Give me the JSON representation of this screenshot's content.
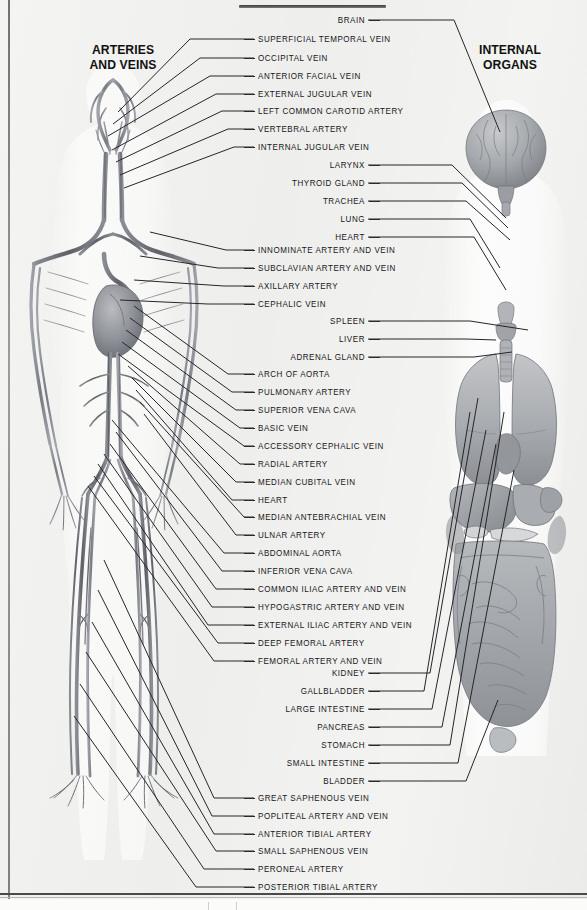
{
  "plate": {
    "heading_left": "ARTERIES\nAND VEINS",
    "heading_left_line1": "ARTERIES",
    "heading_left_line2": "AND VEINS",
    "heading_right_line1": "INTERNAL",
    "heading_right_line2": "ORGANS"
  },
  "labels_left": [
    {
      "text": "SUPERFICIAL TEMPORAL VEIN",
      "y": 39
    },
    {
      "text": "OCCIPITAL VEIN",
      "y": 58
    },
    {
      "text": "ANTERIOR FACIAL VEIN",
      "y": 76
    },
    {
      "text": "EXTERNAL JUGULAR VEIN",
      "y": 94
    },
    {
      "text": "LEFT COMMON CAROTID ARTERY",
      "y": 111
    },
    {
      "text": "VERTEBRAL ARTERY",
      "y": 129
    },
    {
      "text": "INTERNAL JUGULAR VEIN",
      "y": 147
    },
    {
      "text": "INNOMINATE ARTERY AND VEIN",
      "y": 250
    },
    {
      "text": "SUBCLAVIAN ARTERY AND VEIN",
      "y": 268
    },
    {
      "text": "AXILLARY ARTERY",
      "y": 286
    },
    {
      "text": "CEPHALIC VEIN",
      "y": 304
    },
    {
      "text": "ARCH OF AORTA",
      "y": 374
    },
    {
      "text": "PULMONARY ARTERY",
      "y": 392
    },
    {
      "text": "SUPERIOR VENA CAVA",
      "y": 410
    },
    {
      "text": "BASIC VEIN",
      "y": 428
    },
    {
      "text": "ACCESSORY CEPHALIC VEIN",
      "y": 446
    },
    {
      "text": "RADIAL ARTERY",
      "y": 464
    },
    {
      "text": "MEDIAN CUBITAL VEIN",
      "y": 482
    },
    {
      "text": "HEART",
      "y": 500
    },
    {
      "text": "MEDIAN ANTEBRACHIAL VEIN",
      "y": 517
    },
    {
      "text": "ULNAR ARTERY",
      "y": 535
    },
    {
      "text": "ABDOMINAL AORTA",
      "y": 553
    },
    {
      "text": "INFERIOR VENA CAVA",
      "y": 571
    },
    {
      "text": "COMMON ILIAC ARTERY AND VEIN",
      "y": 589
    },
    {
      "text": "HYPOGASTRIC ARTERY AND VEIN",
      "y": 607
    },
    {
      "text": "EXTERNAL ILIAC ARTERY AND VEIN",
      "y": 625
    },
    {
      "text": "DEEP FEMORAL ARTERY",
      "y": 643
    },
    {
      "text": "FEMORAL ARTERY AND VEIN",
      "y": 661
    },
    {
      "text": "GREAT SAPHENOUS VEIN",
      "y": 798
    },
    {
      "text": "POPLITEAL ARTERY AND VEIN",
      "y": 816
    },
    {
      "text": "ANTERIOR TIBIAL ARTERY",
      "y": 834
    },
    {
      "text": "SMALL SAPHENOUS VEIN",
      "y": 851
    },
    {
      "text": "PERONEAL ARTERY",
      "y": 869
    },
    {
      "text": "POSTERIOR TIBIAL ARTERY",
      "y": 887
    }
  ],
  "labels_right": [
    {
      "text": "BRAIN",
      "y": 20
    },
    {
      "text": "LARYNX",
      "y": 165
    },
    {
      "text": "THYROID GLAND",
      "y": 183
    },
    {
      "text": "TRACHEA",
      "y": 201
    },
    {
      "text": "LUNG",
      "y": 219
    },
    {
      "text": "HEART",
      "y": 237
    },
    {
      "text": "SPLEEN",
      "y": 321
    },
    {
      "text": "LIVER",
      "y": 339
    },
    {
      "text": "ADRENAL GLAND",
      "y": 357
    },
    {
      "text": "KIDNEY",
      "y": 673
    },
    {
      "text": "GALLBLADDER",
      "y": 691
    },
    {
      "text": "LARGE INTESTINE",
      "y": 709
    },
    {
      "text": "PANCREAS",
      "y": 727
    },
    {
      "text": "STOMACH",
      "y": 745
    },
    {
      "text": "SMALL INTESTINE",
      "y": 763
    },
    {
      "text": "BLADDER",
      "y": 781
    }
  ],
  "colors": {
    "paper": "#f2f2f0",
    "ink": "#17171a",
    "leader": "#26262a",
    "artery": "#6e7076",
    "vein": "#8d9096",
    "organ_light": "#c9cbcd",
    "organ_mid": "#a3a6aa",
    "organ_dark": "#7d8085"
  }
}
